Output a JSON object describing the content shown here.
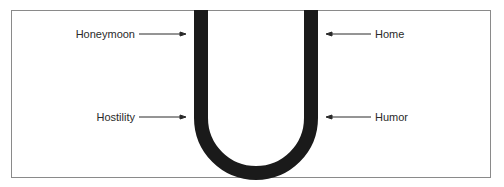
{
  "diagram": {
    "type": "u-curve",
    "labels_left": [
      {
        "text": "Honeymoon",
        "y": 34
      },
      {
        "text": "Hostility",
        "y": 117
      }
    ],
    "labels_right": [
      {
        "text": "Home",
        "y": 34
      },
      {
        "text": "Humor",
        "y": 117
      }
    ],
    "colors": {
      "curve": "#1a1a1a",
      "border": "#8a8a8a",
      "text": "#2a2a2a"
    }
  }
}
